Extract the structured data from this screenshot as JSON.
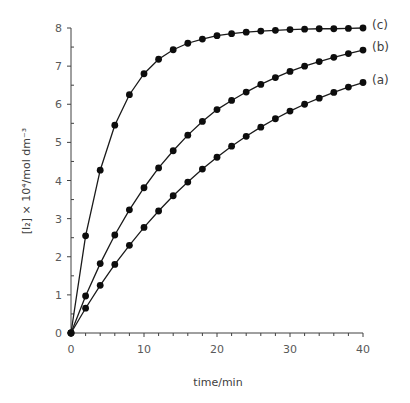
{
  "chart_data": {
    "type": "line",
    "title": "",
    "xlabel": "time/min",
    "ylabel": "[I₂] × 10⁴/mol dm⁻³",
    "xlim": [
      0,
      40
    ],
    "ylim": [
      0,
      8
    ],
    "x_ticks": [
      0,
      10,
      20,
      30,
      40
    ],
    "y_ticks": [
      0,
      1,
      2,
      3,
      4,
      5,
      6,
      7,
      8
    ],
    "grid": false,
    "legend": "inline labels at line ends",
    "x": [
      0,
      2,
      4,
      6,
      8,
      10,
      12,
      14,
      16,
      18,
      20,
      22,
      24,
      26,
      28,
      30,
      32,
      34,
      36,
      38,
      40
    ],
    "series": [
      {
        "name": "(a)",
        "values": [
          0,
          0.65,
          1.25,
          1.8,
          2.3,
          2.77,
          3.2,
          3.6,
          3.96,
          4.3,
          4.61,
          4.9,
          5.16,
          5.4,
          5.62,
          5.82,
          6.0,
          6.16,
          6.31,
          6.45,
          6.57
        ]
      },
      {
        "name": "(b)",
        "values": [
          0,
          0.97,
          1.82,
          2.57,
          3.23,
          3.81,
          4.33,
          4.78,
          5.19,
          5.55,
          5.86,
          6.1,
          6.32,
          6.52,
          6.7,
          6.86,
          7.0,
          7.12,
          7.23,
          7.33,
          7.42
        ]
      },
      {
        "name": "(c)",
        "values": [
          0,
          2.55,
          4.27,
          5.45,
          6.25,
          6.8,
          7.18,
          7.43,
          7.6,
          7.71,
          7.8,
          7.85,
          7.89,
          7.92,
          7.94,
          7.96,
          7.97,
          7.98,
          7.98,
          7.99,
          8.0
        ]
      }
    ]
  },
  "style": {
    "line_color": "#1a1a1a",
    "marker_color": "#0d0d0d",
    "axis_color": "#404040"
  }
}
